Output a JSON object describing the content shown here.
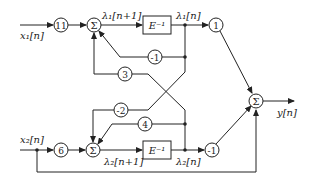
{
  "diagram": {
    "type": "signal-flow block diagram",
    "inputs": {
      "x1": "x₁[n]",
      "x2": "x₂[n]"
    },
    "output": "y[n]",
    "states": {
      "lambda1_next": "λ₁[n+1]",
      "lambda1": "λ₁[n]",
      "lambda2_next": "λ₂[n+1]",
      "lambda2": "λ₂[n]"
    },
    "delay_label": "E⁻¹",
    "sum_symbol": "Σ",
    "gains": {
      "g_x1": "11",
      "g_x2": "6",
      "g_fb11": "-1",
      "g_fb21": "3",
      "g_fb12": "-2",
      "g_fb22": "4",
      "g_out1": "1",
      "g_out2": "-1"
    },
    "colors": {
      "line": "#222222",
      "background": "#ffffff"
    }
  }
}
